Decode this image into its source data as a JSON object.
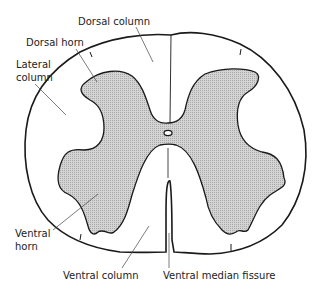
{
  "diagram": {
    "labels": {
      "dorsal_column": "Dorsal column",
      "dorsal_horn": "Dorsal horn",
      "lateral_column_line1": "Lateral",
      "lateral_column_line2": "column",
      "ventral_horn_line1": "Ventral",
      "ventral_horn_line2": "horn",
      "ventral_column": "Ventral column",
      "ventral_median_fissure": "Ventral median fissure"
    },
    "colors": {
      "outline": "#1a1a1a",
      "grey_matter_fill": "#cfcfcf",
      "white_matter_fill": "#ffffff",
      "leader_line": "#444444"
    }
  }
}
